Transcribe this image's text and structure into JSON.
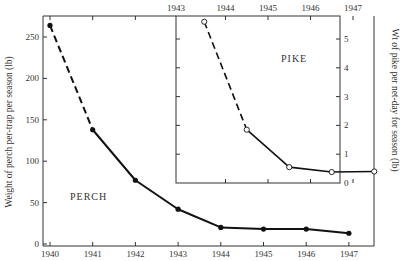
{
  "chart_data": [
    {
      "type": "line",
      "title": "PERCH",
      "xlabel": "",
      "ylabel": "Weight of perch per-trap per season (lb)",
      "x": [
        1940,
        1941,
        1942,
        1943,
        1944,
        1945,
        1946,
        1947
      ],
      "series": [
        {
          "name": "PERCH",
          "values": [
            264,
            138,
            77,
            42,
            20,
            18,
            18,
            13
          ],
          "marker": "filled-circle",
          "segment_style": [
            "dashed",
            "solid",
            "solid",
            "solid",
            "solid",
            "solid",
            "solid"
          ]
        }
      ],
      "xticks": [
        "1940",
        "1941",
        "1942",
        "1943",
        "1944",
        "1945",
        "1946",
        "1947"
      ],
      "yticks": [
        "0",
        "50",
        "100",
        "150",
        "200",
        "250"
      ],
      "ylim": [
        0,
        275
      ],
      "grid": false
    },
    {
      "type": "line",
      "title": "PIKE",
      "xlabel": "",
      "ylabel": "Wt of pike per net-day for season (lb)",
      "x": [
        1943.5,
        1944.5,
        1945.5,
        1946.5,
        1947.5
      ],
      "series": [
        {
          "name": "PIKE",
          "values": [
            5.6,
            1.85,
            0.55,
            0.38,
            0.4
          ],
          "marker": "open-circle",
          "segment_style": [
            "dashed",
            "solid",
            "solid",
            "solid"
          ]
        }
      ],
      "xticks": [
        "1943",
        "1944",
        "1945",
        "1946",
        "1947"
      ],
      "yticks": [
        "0",
        "1",
        "2",
        "3",
        "4",
        "5"
      ],
      "ylim": [
        0,
        5.7
      ],
      "grid": false
    }
  ],
  "labels": {
    "perch": "PERCH",
    "pike": "PIKE",
    "perch_ylabel": "Weight of perch per-trap per season (lb)",
    "pike_ylabel": "Wt of pike per net-day for season (lb)"
  },
  "colors": {
    "line": "#111111",
    "axis": "#333333",
    "background": "#ffffff"
  }
}
